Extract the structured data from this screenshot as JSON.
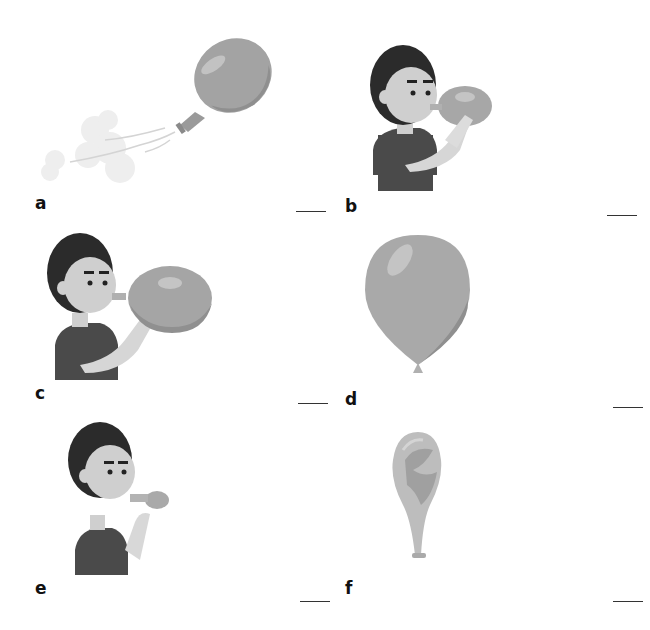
{
  "worksheet": {
    "panels": [
      {
        "id": "a",
        "label": "a",
        "image": "balloon-deflating-flying-icon",
        "answer": ""
      },
      {
        "id": "b",
        "label": "b",
        "image": "boy-blowing-medium-balloon-icon",
        "answer": ""
      },
      {
        "id": "c",
        "label": "c",
        "image": "boy-blowing-large-balloon-icon",
        "answer": ""
      },
      {
        "id": "d",
        "label": "d",
        "image": "fully-inflated-balloon-icon",
        "answer": ""
      },
      {
        "id": "e",
        "label": "e",
        "image": "boy-blowing-small-balloon-icon",
        "answer": ""
      },
      {
        "id": "f",
        "label": "f",
        "image": "empty-deflated-balloon-icon",
        "answer": ""
      }
    ]
  },
  "colors": {
    "balloon": "#a9a9a9",
    "balloon_shade": "#8f8f8f",
    "highlight": "#c4c4c4",
    "hair": "#2b2b2b",
    "skin": "#cfcfcf",
    "shirt": "#4a4a4a",
    "cloud": "#ececec"
  }
}
